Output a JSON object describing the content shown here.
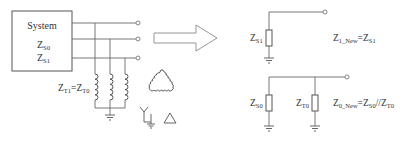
{
  "system_box": {
    "title": "System",
    "impedance_zero": {
      "base": "Z",
      "sub": "S0"
    },
    "impedance_positive": {
      "base": "Z",
      "sub": "S1"
    }
  },
  "transformer": {
    "label": {
      "left_base": "Z",
      "left_sub": "T1",
      "eq": "=",
      "right_base": "Z",
      "right_sub": "T0"
    },
    "winding_symbols": [
      "grounded-wye",
      "delta"
    ]
  },
  "arrow": {
    "direction": "right",
    "meaning": "transforms-to"
  },
  "positive_sequence": {
    "resistor_label": {
      "base": "Z",
      "sub": "S1"
    },
    "equation": {
      "lhs_base": "Z",
      "lhs_sub": "1_New",
      "eq": "=",
      "rhs_base": "Z",
      "rhs_sub": "S1"
    }
  },
  "zero_sequence": {
    "resistor_labels": [
      {
        "base": "Z",
        "sub": "S0"
      },
      {
        "base": "Z",
        "sub": "T0"
      }
    ],
    "equation": {
      "lhs_base": "Z",
      "lhs_sub": "0_New",
      "eq": "=",
      "rhs_base": "Z",
      "rhs_sub": "S0",
      "op": "//",
      "rhs2_base": "Z",
      "rhs2_sub": "T0"
    }
  },
  "colors": {
    "line": "#6a6a6a",
    "text": "#333333",
    "arrow": "#8a8a8a",
    "background": "#ffffff"
  }
}
